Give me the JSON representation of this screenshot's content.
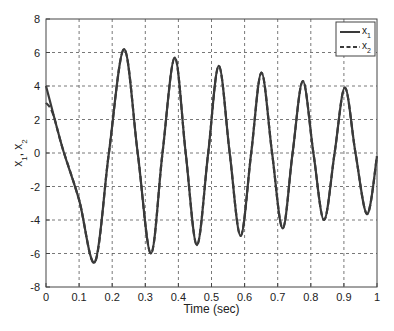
{
  "chart_data": {
    "type": "line",
    "title": "",
    "xlabel": "Time (sec)",
    "ylabel_main": "x",
    "ylabel_parts": [
      {
        "text": "x",
        "sub": "1"
      },
      {
        "text": ", x",
        "sub": "2"
      }
    ],
    "xlim": [
      0,
      1
    ],
    "ylim": [
      -8,
      8
    ],
    "xticks": [
      0,
      0.1,
      0.2,
      0.3,
      0.4,
      0.5,
      0.6,
      0.7,
      0.8,
      0.9,
      1
    ],
    "xtick_labels": [
      "0",
      "0.1",
      "0.2",
      "0.3",
      "0.4",
      "0.5",
      "0.6",
      "0.7",
      "0.8",
      "0.9",
      "1"
    ],
    "yticks": [
      -8,
      -6,
      -4,
      -2,
      0,
      2,
      4,
      6,
      8
    ],
    "ytick_labels": [
      "-8",
      "-6",
      "-4",
      "-2",
      "0",
      "2",
      "4",
      "6",
      "8"
    ],
    "grid": true,
    "legend_position": "upper right",
    "series": [
      {
        "name": "x1",
        "label": "x",
        "label_sub": "1",
        "style": "solid",
        "color": "#3a3a3a",
        "points": [
          [
            0,
            4.0
          ],
          [
            0.05,
            0.3
          ],
          [
            0.1,
            -2.8
          ],
          [
            0.148,
            -6.5
          ],
          [
            0.19,
            0.0
          ],
          [
            0.236,
            6.2
          ],
          [
            0.277,
            0.0
          ],
          [
            0.317,
            -6.0
          ],
          [
            0.352,
            0.0
          ],
          [
            0.389,
            5.7
          ],
          [
            0.422,
            0.0
          ],
          [
            0.456,
            -5.5
          ],
          [
            0.49,
            0.0
          ],
          [
            0.522,
            5.2
          ],
          [
            0.555,
            0.0
          ],
          [
            0.588,
            -4.95
          ],
          [
            0.62,
            0.0
          ],
          [
            0.651,
            4.8
          ],
          [
            0.683,
            0.0
          ],
          [
            0.715,
            -4.5
          ],
          [
            0.745,
            0.0
          ],
          [
            0.776,
            4.3
          ],
          [
            0.808,
            0.0
          ],
          [
            0.84,
            -4.0
          ],
          [
            0.872,
            0.0
          ],
          [
            0.903,
            3.9
          ],
          [
            0.935,
            0.0
          ],
          [
            0.97,
            -3.65
          ],
          [
            1.0,
            -0.2
          ]
        ]
      },
      {
        "name": "x2",
        "label": "x",
        "label_sub": "2",
        "style": "dashed",
        "color": "#3a3a3a",
        "points": [
          [
            0,
            3.0
          ],
          [
            0.02,
            2.4
          ],
          [
            0.05,
            0.3
          ],
          [
            0.1,
            -2.8
          ],
          [
            0.148,
            -6.5
          ],
          [
            0.19,
            0.0
          ],
          [
            0.236,
            6.2
          ],
          [
            0.277,
            0.0
          ],
          [
            0.317,
            -6.0
          ],
          [
            0.352,
            0.0
          ],
          [
            0.389,
            5.7
          ],
          [
            0.422,
            0.0
          ],
          [
            0.456,
            -5.5
          ],
          [
            0.49,
            0.0
          ],
          [
            0.522,
            5.2
          ],
          [
            0.555,
            0.0
          ],
          [
            0.588,
            -4.95
          ],
          [
            0.62,
            0.0
          ],
          [
            0.651,
            4.8
          ],
          [
            0.683,
            0.0
          ],
          [
            0.715,
            -4.5
          ],
          [
            0.745,
            0.0
          ],
          [
            0.776,
            4.3
          ],
          [
            0.808,
            0.0
          ],
          [
            0.84,
            -4.0
          ],
          [
            0.872,
            0.0
          ],
          [
            0.903,
            3.9
          ],
          [
            0.935,
            0.0
          ],
          [
            0.97,
            -3.65
          ],
          [
            1.0,
            -0.2
          ]
        ]
      }
    ]
  },
  "legend": {
    "items": [
      {
        "label": "x",
        "sub": "1",
        "style": "solid"
      },
      {
        "label": "x",
        "sub": "2",
        "style": "dashed"
      }
    ]
  },
  "axes": {
    "xlabel": "Time (sec)"
  }
}
